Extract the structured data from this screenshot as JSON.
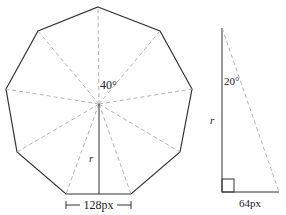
{
  "nonagon": {
    "center": [
      99,
      104
    ],
    "vertices": [
      [
        98,
        7
      ],
      [
        160,
        31
      ],
      [
        192,
        89
      ],
      [
        180,
        152
      ],
      [
        131,
        194
      ],
      [
        66,
        194
      ],
      [
        17,
        152
      ],
      [
        6,
        89
      ],
      [
        38,
        31
      ]
    ],
    "angle_label": "40°",
    "radius_label": "r",
    "side_label": "128px"
  },
  "triangle": {
    "top": [
      222,
      28
    ],
    "bottom_left": [
      222,
      192
    ],
    "bottom_right": [
      279,
      192
    ],
    "angle_label": "20°",
    "radius_label": "r",
    "base_label": "64px"
  },
  "colors": {
    "stroke": "#333333",
    "dashed": "#aaaaaa",
    "text": "#222222"
  }
}
